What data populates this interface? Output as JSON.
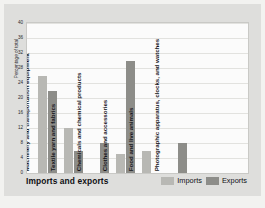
{
  "chart_data": {
    "type": "bar",
    "title": "Imports and exports",
    "xlabel": "",
    "ylabel": "Percentage of total",
    "ylim": [
      0,
      40
    ],
    "yticks": [
      40,
      36,
      32,
      28,
      24,
      20,
      16,
      12,
      8,
      4,
      0
    ],
    "grid": true,
    "legend_position": "bottom-right",
    "categories": [
      "Machinery and transportation equipment",
      "Textile yarn and fabrics",
      "Chemicals and chemical products",
      "Clothes and accessories",
      "Food and live animals",
      "Photographic apparatus, clocks, and watches"
    ],
    "series": [
      {
        "name": "Imports",
        "color": "#b8b8b4",
        "values": [
          26,
          12,
          0,
          5,
          6,
          0
        ]
      },
      {
        "name": "Exports",
        "color": "#8d8d89",
        "values": [
          22,
          6,
          8,
          30,
          0,
          8
        ]
      }
    ]
  },
  "legend": {
    "items": [
      {
        "label": "Imports"
      },
      {
        "label": "Exports"
      }
    ]
  },
  "colors": {
    "imports": "#b8b8b4",
    "exports": "#8d8d89",
    "figure_background": "#dededc",
    "plot_background": "#fbfbfb",
    "gridline": "#e2e2df"
  }
}
